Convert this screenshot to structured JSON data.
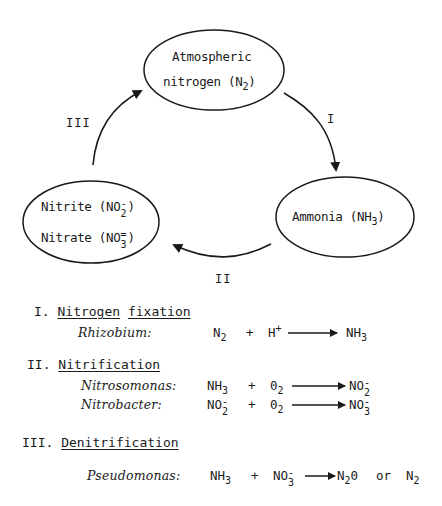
{
  "diagram": {
    "nodes": {
      "atmospheric": {
        "line1": "Atmospheric",
        "line2_prefix": "nitrogen (N",
        "line2_sub": "2",
        "line2_suffix": ")"
      },
      "ammonia": {
        "prefix": "Ammonia (NH",
        "sub": "3",
        "suffix": ")"
      },
      "nitrite_nitrate": {
        "nitrite_prefix": "Nitrite (NO",
        "nitrite_sup": "-",
        "nitrite_sub": "2",
        "nitrite_suffix": ")",
        "nitrate_prefix": "Nitrate (NO",
        "nitrate_sup": "=",
        "nitrate_sub": "3",
        "nitrate_suffix": ")"
      }
    },
    "arrows": [
      {
        "label": "I",
        "from": "Atmospheric nitrogen (N2)",
        "to": "Ammonia (NH3)"
      },
      {
        "label": "II",
        "from": "Ammonia (NH3)",
        "to": "Nitrite/Nitrate"
      },
      {
        "label": "III",
        "from": "Nitrite/Nitrate",
        "to": "Atmospheric nitrogen (N2)"
      }
    ]
  },
  "processes": [
    {
      "numeral": "I.",
      "title_words": [
        "Nitrogen",
        "fixation"
      ],
      "reactions": [
        {
          "organism": "Rhizobium:",
          "r1": "N",
          "r1_sub": "2",
          "plus": "+",
          "r2": "H",
          "r2_sup": "+",
          "p1": "NH",
          "p1_sub": "3"
        }
      ]
    },
    {
      "numeral": "II.",
      "title_words": [
        "Nitrification"
      ],
      "reactions": [
        {
          "organism": "Nitrosomonas:",
          "r1": "NH",
          "r1_sub": "3",
          "plus": "+",
          "r2": "0",
          "r2_sub": "2",
          "p1": "NO",
          "p1_sup": "-",
          "p1_sub": "2"
        },
        {
          "organism": "Nitrobacter:",
          "r1": "NO",
          "r1_sup": "-",
          "r1_sub": "2",
          "plus": "+",
          "r2": "0",
          "r2_sub": "2",
          "p1": "NO",
          "p1_sup": "-",
          "p1_sub": "3"
        }
      ]
    },
    {
      "numeral": "III.",
      "title_words": [
        "Denitrification"
      ],
      "reactions": [
        {
          "organism": "Pseudomonas:",
          "r1": "NH",
          "r1_sub": "3",
          "plus": "+",
          "r2": "NO",
          "r2_sup": "-",
          "r2_sub": "3",
          "p1": "N",
          "p1_sub": "2",
          "p1_suffix": "0",
          "or": "or",
          "p2": "N",
          "p2_sub": "2"
        }
      ]
    }
  ]
}
